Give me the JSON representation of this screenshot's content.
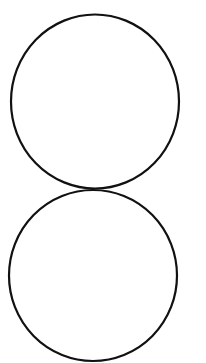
{
  "canvas": {
    "width": 206,
    "height": 363,
    "background": "#ffffff"
  },
  "shapes": [
    {
      "type": "ellipse",
      "name": "upper-circle",
      "cx": 95,
      "cy": 101.5,
      "rx": 84,
      "ry": 87,
      "stroke": "#111111",
      "stroke_width": 2.2,
      "fill": "none"
    },
    {
      "type": "ellipse",
      "name": "lower-circle",
      "cx": 93,
      "cy": 275.5,
      "rx": 84,
      "ry": 85.5,
      "stroke": "#111111",
      "stroke_width": 2.2,
      "fill": "none"
    }
  ]
}
